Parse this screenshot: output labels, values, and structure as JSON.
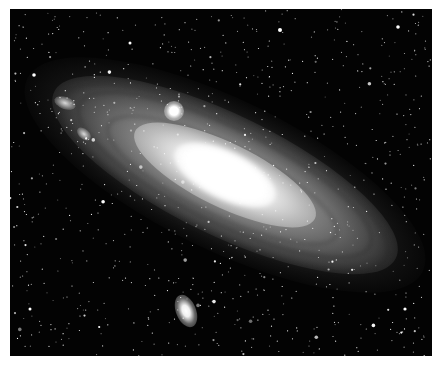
{
  "image": {
    "subject": "Spiral galaxy photograph (Andromeda-like) on black star field",
    "frame": {
      "x": 10,
      "y": 9,
      "width": 422,
      "height": 347,
      "border_color": "#ffffff",
      "background": "#030303"
    },
    "galaxy": {
      "core_center": [
        215,
        166
      ],
      "tilt_deg": 26,
      "major_axis_px": 380,
      "minor_axis_px": 120,
      "core_color": "#ffffff",
      "disk_color": "#b4b4b4"
    },
    "companions": [
      {
        "name": "upper-companion",
        "center": [
          164,
          102
        ],
        "size": [
          20,
          20
        ]
      },
      {
        "name": "lower-companion",
        "center": [
          176,
          302
        ],
        "size": [
          20,
          34
        ]
      }
    ]
  }
}
